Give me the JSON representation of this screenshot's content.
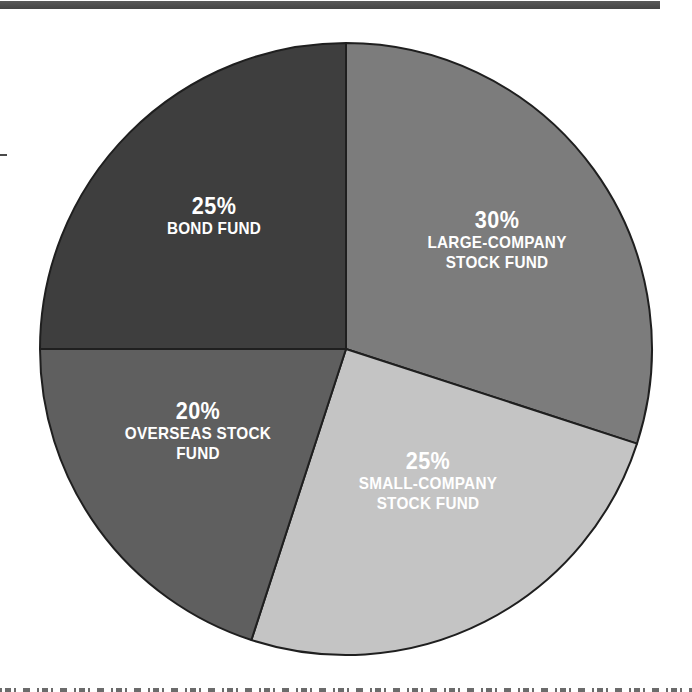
{
  "page": {
    "background": "#ffffff"
  },
  "decor": {
    "top_bar_color": "#4e4e4e",
    "margin_mark_color": "#4a4a4a",
    "cropped_caption_color": "#3a3a3a"
  },
  "chart_data": {
    "type": "pie",
    "title": "",
    "start_angle_deg": 0,
    "direction": "clockwise",
    "center": {
      "x": 346,
      "y": 349
    },
    "radius": 306,
    "outline_color": "#1f1f1f",
    "label_color": "#ffffff",
    "legend_position": "none",
    "segments": [
      {
        "id": "large-company-stock-fund",
        "percent_label": "30%",
        "value": 30,
        "name_lines": [
          "LARGE-COMPANY",
          "STOCK FUND"
        ],
        "color": "#7c7c7c",
        "label": {
          "x": 497,
          "top": 207
        }
      },
      {
        "id": "small-company-stock-fund",
        "percent_label": "25%",
        "value": 25,
        "name_lines": [
          "SMALL-COMPANY",
          "STOCK FUND"
        ],
        "color": "#c4c4c4",
        "label": {
          "x": 428,
          "top": 448
        }
      },
      {
        "id": "overseas-stock-fund",
        "percent_label": "20%",
        "value": 20,
        "name_lines": [
          "OVERSEAS STOCK",
          "FUND"
        ],
        "color": "#5f5f5f",
        "label": {
          "x": 198,
          "top": 398
        }
      },
      {
        "id": "bond-fund",
        "percent_label": "25%",
        "value": 25,
        "name_lines": [
          "BOND FUND"
        ],
        "color": "#3e3e3e",
        "label": {
          "x": 214,
          "top": 193
        }
      }
    ]
  }
}
